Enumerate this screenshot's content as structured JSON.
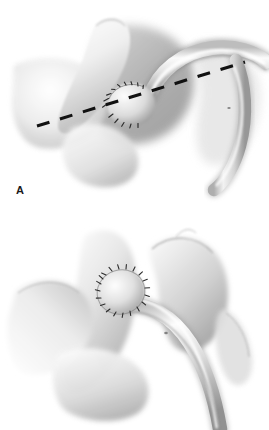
{
  "figure": {
    "kind": "medical-surgical-illustration",
    "technique": "grayscale airbrush / stipple rendering",
    "background_color": "#ffffff",
    "ink_color": "#1a1a1a",
    "panel_count": 2
  },
  "panels": [
    {
      "id": "A",
      "label": "A",
      "caption": "Anastomosis completed with interrupted sutures; dashed line marks the planned transection.",
      "features": {
        "suture_line_style": "interrupted running stitches along oblique anastomosis",
        "suture_count": 14,
        "dashed_line_present": true,
        "dashed_line_color": "#111111",
        "dashed_line_label": "planned transection line",
        "dash_count": 7,
        "vessel_orientation": "graft enters from upper right and loops left to the anastomosis"
      }
    },
    {
      "id": "B",
      "label": "B",
      "caption": "Completed circular anastomosis after transection; graft vessel courses inferiorly.",
      "features": {
        "suture_line_style": "circumferential ring of interrupted sutures",
        "suture_count": 20,
        "dashed_line_present": false,
        "vessel_orientation": "graft descends toward the lower right of the field"
      }
    }
  ],
  "palette": {
    "paper": "#ffffff",
    "tissue_light": "#f3f3f3",
    "tissue_mid": "#d8d8d8",
    "tissue_shadow": "#a9a9a9",
    "tissue_deep": "#8a8a8a",
    "outline": "#6e6e6e",
    "suture": "#2b2b2b",
    "dash": "#111111"
  }
}
